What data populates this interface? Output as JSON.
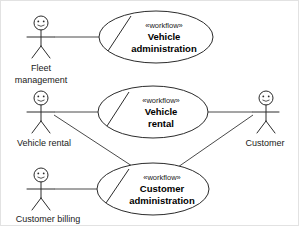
{
  "diagram": {
    "kind": "uml-use-case-diagram",
    "width": 299,
    "height": 226,
    "colors": {
      "background": "#ffffff",
      "stroke": "#2b2b2b",
      "edge": "#4a4a4a",
      "text": "#1a1a1a",
      "border": "#e2e2e2"
    },
    "stereotype_label": "«workflow»",
    "usecases": [
      {
        "id": "vehicle-administration",
        "stereotype": "«workflow»",
        "name_line1": "Vehicle",
        "name_line2": "administration",
        "cx": 155,
        "cy": 36,
        "rx": 57,
        "ry": 26
      },
      {
        "id": "vehicle-rental",
        "stereotype": "«workflow»",
        "name_line1": "Vehicle",
        "name_line2": "rental",
        "cx": 152,
        "cy": 111,
        "rx": 55,
        "ry": 26
      },
      {
        "id": "customer-administration",
        "stereotype": "«workflow»",
        "name_line1": "Customer",
        "name_line2": "administration",
        "cx": 152,
        "cy": 188,
        "rx": 56,
        "ry": 26
      }
    ],
    "actors": [
      {
        "id": "fleet-management",
        "label_line1": "Fleet",
        "label_line2": "management",
        "x": 40,
        "y": 16,
        "side": "left"
      },
      {
        "id": "vehicle-rental-actor",
        "label_line1": "Vehicle rental",
        "label_line2": "",
        "x": 40,
        "y": 92,
        "side": "left"
      },
      {
        "id": "customer-billing",
        "label_line1": "Customer billing",
        "label_line2": "",
        "x": 40,
        "y": 168,
        "side": "left"
      },
      {
        "id": "customer",
        "label_line1": "Customer",
        "label_line2": "",
        "x": 265,
        "y": 92,
        "side": "right"
      }
    ],
    "associations": [
      {
        "id": "fleet-management--vehicle-administration",
        "from": "fleet-management",
        "to": "vehicle-administration"
      },
      {
        "id": "vehicle-rental-actor--vehicle-rental",
        "from": "vehicle-rental-actor",
        "to": "vehicle-rental"
      },
      {
        "id": "vehicle-rental-actor--customer-administration",
        "from": "vehicle-rental-actor",
        "to": "customer-administration"
      },
      {
        "id": "customer--vehicle-rental",
        "from": "customer",
        "to": "vehicle-rental"
      },
      {
        "id": "customer--customer-administration",
        "from": "customer",
        "to": "customer-administration"
      },
      {
        "id": "customer-billing--customer-administration",
        "from": "customer-billing",
        "to": "customer-administration"
      }
    ]
  }
}
